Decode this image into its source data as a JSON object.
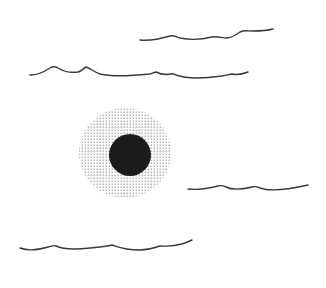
{
  "canvas": {
    "width": 326,
    "height": 288,
    "background": "#ffffff",
    "description": "Minimal line illustration: black sun disc with stippled halo among wavy lines"
  },
  "colors": {
    "ink": "#1c1c1c",
    "line": "#3a3a3a",
    "stipple": "#8a8a8a"
  },
  "sun": {
    "icon": "sun-disc-icon",
    "center": [
      130,
      155
    ],
    "radius": 21,
    "halo": {
      "icon": "stipple-halo-icon",
      "center": [
        125,
        153
      ],
      "radius_x": 46,
      "radius_y": 45,
      "dot_spacing": 3
    }
  },
  "waves": [
    {
      "id": "wave-1",
      "path": "M140,40 C150,41 160,39 170,36 C174,35 176,37 180,38 C190,40 200,40 212,37 C218,36 222,38 226,38 C232,38 236,35 240,32 C244,30 248,31 252,31 C258,31 266,31 273,29"
    },
    {
      "id": "wave-2",
      "path": "M30,75 C38,75 44,72 50,68 C53,66 55,66 58,68 C64,72 70,73 78,72 C82,71 84,68 86,67 C90,68 94,72 100,74 C112,77 130,76 150,74 C154,73 154,72 156,72 C160,74 166,75 170,74 C173,73 174,74 176,75 C184,78 200,79 222,76 C228,75 230,74 232,74 C236,75 240,75 248,72"
    },
    {
      "id": "wave-3",
      "path": "M188,189 C196,190 206,189 218,186 C222,185 224,186 226,187 C232,190 240,190 252,187 C256,186 258,187 260,188 C268,191 286,190 308,185"
    },
    {
      "id": "wave-4",
      "path": "M20,248 C28,251 38,250 48,247 C52,246 54,245 56,246 C62,249 72,250 90,248 C100,247 108,246 112,245 C118,247 124,250 140,250 C150,250 156,247 160,246 C166,246 172,247 182,244 C186,243 188,242 192,240"
    }
  ]
}
